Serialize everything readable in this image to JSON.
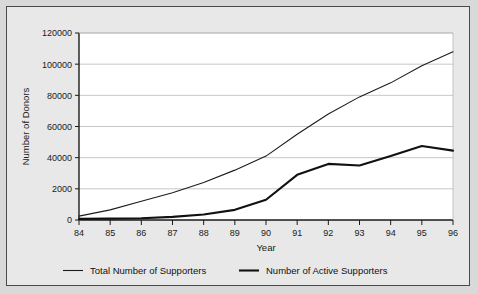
{
  "figure": {
    "background": "#e8e8e8",
    "plot_background": "#ffffff",
    "border_color": "#4a4a4a"
  },
  "chart_data": {
    "type": "line",
    "title": "",
    "xlabel": "Year",
    "ylabel": "Number of Donors",
    "x": [
      "84",
      "85",
      "86",
      "87",
      "88",
      "89",
      "90",
      "91",
      "92",
      "93",
      "94",
      "95",
      "96"
    ],
    "xtick_labels": [
      "84",
      "85",
      "86",
      "87",
      "88",
      "89",
      "90",
      "91",
      "92",
      "93",
      "94",
      "95",
      "96"
    ],
    "ytick_labels": [
      "0",
      "2000",
      "40000",
      "60000",
      "80000",
      "100000",
      "120000"
    ],
    "ytick_values": [
      0,
      20000,
      40000,
      60000,
      80000,
      100000,
      120000
    ],
    "ylim": [
      0,
      120000
    ],
    "xlim": [
      84,
      96
    ],
    "grid": "horizontal",
    "legend_position": "below",
    "series": [
      {
        "name": "Total Number of Supporters",
        "color": "#1c1c1c",
        "width": 1.1,
        "values": [
          2500,
          6500,
          12000,
          17500,
          24000,
          32000,
          41000,
          55000,
          68000,
          79000,
          88000,
          99000,
          108000
        ]
      },
      {
        "name": "Number of Active Supporters",
        "color": "#111111",
        "width": 2.1,
        "values": [
          700,
          900,
          1100,
          2000,
          3500,
          6500,
          13000,
          29000,
          36000,
          35000,
          41000,
          47500,
          44500
        ]
      }
    ]
  },
  "legend": {
    "items": [
      {
        "label": "Total Number of Supporters",
        "color": "#1c1c1c",
        "width": 1.1
      },
      {
        "label": "Number of Active Supporters",
        "color": "#111111",
        "width": 2.1
      }
    ]
  }
}
